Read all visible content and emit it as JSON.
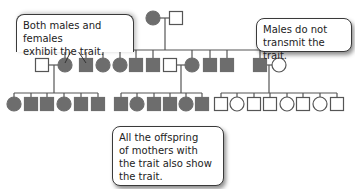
{
  "diagram": {
    "type": "pedigree",
    "title": "",
    "colors": {
      "affected": "#6d6d6d",
      "unaffected_fill": "#ffffff",
      "line": "#555555"
    },
    "callouts": [
      {
        "id": "both",
        "text": "Both males and females\nexhibit the trait."
      },
      {
        "id": "males",
        "text": "Males do not\ntransmit the trait."
      },
      {
        "id": "offspring",
        "text": "All the offspring\nof mothers with\nthe trait also show\nthe trait."
      }
    ],
    "legend": {
      "square": "male",
      "circle": "female",
      "filled": "affected (shows trait)",
      "open": "unaffected"
    },
    "generations": [
      {
        "label": "I",
        "individuals": [
          {
            "sex": "female",
            "affected": true
          },
          {
            "sex": "male",
            "affected": false
          }
        ]
      },
      {
        "label": "II",
        "individuals": [
          {
            "sex": "male",
            "affected": false,
            "role": "spouse"
          },
          {
            "sex": "female",
            "affected": true
          },
          {
            "sex": "male",
            "affected": true
          },
          {
            "sex": "female",
            "affected": true
          },
          {
            "sex": "female",
            "affected": true
          },
          {
            "sex": "male",
            "affected": true
          },
          {
            "sex": "male",
            "affected": true
          },
          {
            "sex": "male",
            "affected": false,
            "role": "spouse"
          },
          {
            "sex": "female",
            "affected": true
          },
          {
            "sex": "male",
            "affected": true
          },
          {
            "sex": "male",
            "affected": true
          },
          {
            "sex": "male",
            "affected": true
          },
          {
            "sex": "female",
            "affected": false,
            "role": "spouse"
          }
        ]
      },
      {
        "label": "III",
        "sibships": [
          {
            "parents": "unaffected male x affected female",
            "children": [
              {
                "sex": "female",
                "affected": true
              },
              {
                "sex": "male",
                "affected": true
              },
              {
                "sex": "male",
                "affected": true
              },
              {
                "sex": "female",
                "affected": true
              },
              {
                "sex": "male",
                "affected": true
              },
              {
                "sex": "male",
                "affected": true
              }
            ]
          },
          {
            "parents": "unaffected male x affected female",
            "children": [
              {
                "sex": "male",
                "affected": true
              },
              {
                "sex": "female",
                "affected": true
              },
              {
                "sex": "male",
                "affected": true
              },
              {
                "sex": "male",
                "affected": true
              },
              {
                "sex": "female",
                "affected": true
              },
              {
                "sex": "male",
                "affected": true
              }
            ]
          },
          {
            "parents": "affected male x unaffected female",
            "children": [
              {
                "sex": "male",
                "affected": false
              },
              {
                "sex": "female",
                "affected": false
              },
              {
                "sex": "male",
                "affected": false
              },
              {
                "sex": "male",
                "affected": false
              },
              {
                "sex": "female",
                "affected": false
              },
              {
                "sex": "male",
                "affected": false
              },
              {
                "sex": "female",
                "affected": false
              },
              {
                "sex": "male",
                "affected": false
              }
            ]
          }
        ]
      }
    ]
  }
}
